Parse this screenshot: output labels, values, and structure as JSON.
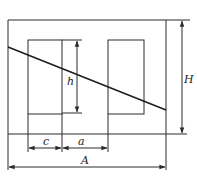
{
  "diagram": {
    "colors": {
      "stroke": "#2a2a2a",
      "background": "#ffffff"
    },
    "labels": {
      "height_window": "h",
      "height_total": "H",
      "width_c": "c",
      "width_a": "a",
      "width_total": "A"
    }
  }
}
